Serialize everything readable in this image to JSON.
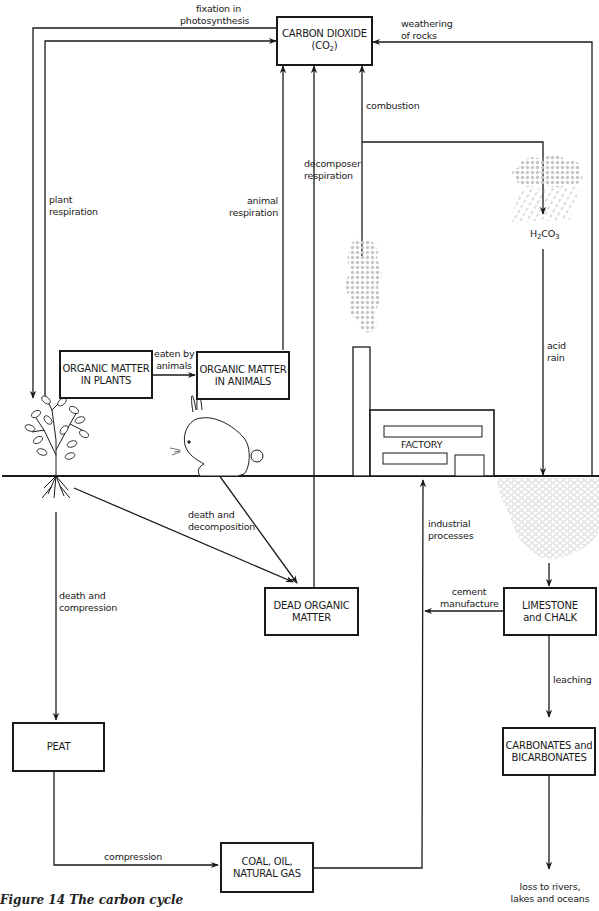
{
  "figure": {
    "caption": "Figure 14  The carbon cycle"
  },
  "nodes": {
    "co2": {
      "line1": "CARBON DIOXIDE",
      "line2_prefix": "(CO",
      "line2_sub": "2",
      "line2_suffix": ")"
    },
    "organic_plants": {
      "line1": "ORGANIC MATTER",
      "line2": "IN PLANTS"
    },
    "organic_animals": {
      "line1": "ORGANIC MATTER",
      "line2": "IN ANIMALS"
    },
    "dead_organic": {
      "line1": "DEAD ORGANIC",
      "line2": "MATTER"
    },
    "limestone": {
      "line1": "LIMESTONE",
      "line2": "and CHALK"
    },
    "peat": {
      "line1": "PEAT"
    },
    "fossil": {
      "line1": "COAL, OIL,",
      "line2": "NATURAL GAS"
    },
    "carbonates": {
      "line1": "CARBONATES and",
      "line2": "BICARBONATES"
    },
    "factory": {
      "label": "FACTORY"
    },
    "carbonic_acid": {
      "prefix": "H",
      "sub1": "2",
      "mid": "CO",
      "sub2": "3"
    }
  },
  "edges": {
    "fixation": {
      "line1": "fixation in",
      "line2": "photosynthesis"
    },
    "weathering": {
      "line1": "weathering",
      "line2": "of rocks"
    },
    "combustion": {
      "line1": "combustion"
    },
    "decomposer": {
      "line1": "decomposer",
      "line2": "respiration"
    },
    "plant_resp": {
      "line1": "plant",
      "line2": "respiration"
    },
    "animal_resp": {
      "line1": "animal",
      "line2": "respiration"
    },
    "eaten": {
      "line1": "eaten by",
      "line2": "animals"
    },
    "acid_rain": {
      "line1": "acid",
      "line2": "rain"
    },
    "death_decomp": {
      "line1": "death and",
      "line2": "decomposition"
    },
    "industrial": {
      "line1": "industrial",
      "line2": "processes"
    },
    "cement": {
      "line1": "cement",
      "line2": "manufacture"
    },
    "death_compress": {
      "line1": "death and",
      "line2": "compression"
    },
    "leaching": {
      "line1": "leaching"
    },
    "compression": {
      "line1": "compression"
    },
    "loss": {
      "line1": "loss to rivers,",
      "line2": "lakes and oceans"
    }
  },
  "illustrations": {
    "tree": "tree-icon",
    "rabbit": "rabbit-icon",
    "factory": "factory-icon",
    "smoke": "smoke-icon",
    "rain_cloud": "rain-cloud-icon",
    "limestone_rock": "rock-icon"
  },
  "colors": {
    "line": "#1a1a1a",
    "shade": "#b8b8b8",
    "background": "#ffffff"
  }
}
